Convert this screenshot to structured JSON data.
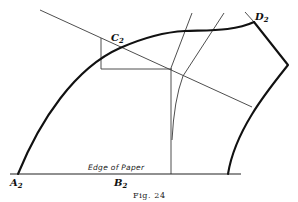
{
  "figure": {
    "caption": "Fig. 24",
    "edge_label": "Edge of Paper",
    "points": {
      "A2": {
        "letter": "A",
        "sub": "2"
      },
      "B2": {
        "letter": "B",
        "sub": "2"
      },
      "C2": {
        "letter": "C",
        "sub": "2"
      },
      "D2": {
        "letter": "D",
        "sub": "2"
      }
    },
    "colors": {
      "ink": "#111111",
      "background": "#ffffff"
    }
  }
}
